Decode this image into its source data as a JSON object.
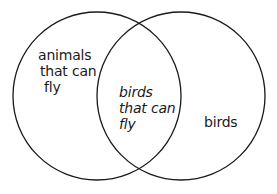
{
  "diagram": {
    "type": "venn",
    "sets": [
      {
        "id": "left",
        "label": [
          "animals",
          "that can",
          "fly"
        ]
      },
      {
        "id": "right",
        "label": [
          "birds"
        ]
      }
    ],
    "intersection": {
      "label": [
        "birds",
        "that can",
        "fly"
      ],
      "italic": true
    },
    "colors": {
      "stroke": "#1a1a1a",
      "background": "#ffffff"
    }
  }
}
